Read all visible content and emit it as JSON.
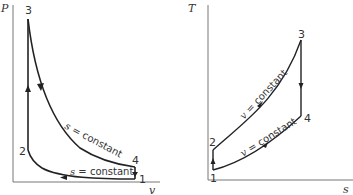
{
  "diagrams": [
    {
      "id": "pv",
      "axes": {
        "y_label": "P",
        "x_label": "v"
      },
      "points": [
        {
          "label": "1",
          "x": 135,
          "y": 179
        },
        {
          "label": "2",
          "x": 28,
          "y": 150
        },
        {
          "label": "3",
          "x": 28,
          "y": 19
        },
        {
          "label": "4",
          "x": 135,
          "y": 167
        }
      ],
      "curves": [
        {
          "from": "3",
          "to": "4",
          "label_var": "s",
          "label_rest": " = constant"
        },
        {
          "from": "1",
          "to": "2",
          "label_var": "s",
          "label_rest": " = constant"
        }
      ]
    },
    {
      "id": "ts",
      "axes": {
        "y_label": "T",
        "x_label": "s"
      },
      "points": [
        {
          "label": "1",
          "x": 213,
          "y": 170
        },
        {
          "label": "2",
          "x": 213,
          "y": 150
        },
        {
          "label": "3",
          "x": 301,
          "y": 40
        },
        {
          "label": "4",
          "x": 301,
          "y": 116
        }
      ],
      "curves": [
        {
          "from": "2",
          "to": "3",
          "label_var": "v",
          "label_rest": " = constant"
        },
        {
          "from": "4",
          "to": "1",
          "label_var": "v",
          "label_rest": " = constant"
        }
      ]
    }
  ],
  "text": {
    "pv_y": "P",
    "pv_x": "v",
    "pv_p1": "1",
    "pv_p2": "2",
    "pv_p3": "3",
    "pv_p4": "4",
    "pv_curve_top_var": "s",
    "pv_curve_top_rest": " = constant",
    "pv_curve_bot_var": "s",
    "pv_curve_bot_rest": " = constant",
    "ts_y": "T",
    "ts_x": "s",
    "ts_p1": "1",
    "ts_p2": "2",
    "ts_p3": "3",
    "ts_p4": "4",
    "ts_curve_top_var": "v",
    "ts_curve_top_rest": " = constant",
    "ts_curve_bot_var": "v",
    "ts_curve_bot_rest": " = constant"
  }
}
